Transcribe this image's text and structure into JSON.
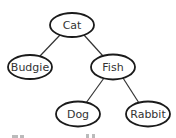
{
  "diagram": {
    "type": "tree",
    "nodes": [
      {
        "id": "cat",
        "label": "Cat",
        "cx": 72,
        "cy": 25,
        "rx": 22,
        "ry": 12
      },
      {
        "id": "budgie",
        "label": "Budgie",
        "cx": 30,
        "cy": 67,
        "rx": 22,
        "ry": 12
      },
      {
        "id": "fish",
        "label": "Fish",
        "cx": 113,
        "cy": 67,
        "rx": 22,
        "ry": 12
      },
      {
        "id": "dog",
        "label": "Dog",
        "cx": 78,
        "cy": 114,
        "rx": 22,
        "ry": 12
      },
      {
        "id": "rabbit",
        "label": "Rabbit",
        "cx": 148,
        "cy": 114,
        "rx": 22,
        "ry": 12
      }
    ],
    "edges": [
      {
        "from": "cat",
        "to": "budgie"
      },
      {
        "from": "cat",
        "to": "fish"
      },
      {
        "from": "fish",
        "to": "dog"
      },
      {
        "from": "fish",
        "to": "rabbit"
      }
    ],
    "colors": {
      "stroke": "#1a1a1a",
      "edge": "#333333",
      "text": "#333333",
      "background": "#ffffff"
    }
  }
}
